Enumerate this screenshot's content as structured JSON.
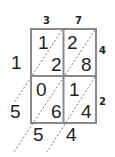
{
  "top_factor": [
    "3",
    "7"
  ],
  "right_factor": [
    "4",
    "2"
  ],
  "cells": [
    {
      "tens": "1",
      "ones": "2"
    },
    {
      "tens": "2",
      "ones": "8"
    },
    {
      "tens": "0",
      "ones": "6"
    },
    {
      "tens": "1",
      "ones": "4"
    }
  ],
  "result_left": [
    "1",
    "5"
  ],
  "result_bottom": [
    "5",
    "4"
  ],
  "colors": {
    "grid": "#8a8a8a",
    "diag": "#555555",
    "text": "#222222"
  }
}
